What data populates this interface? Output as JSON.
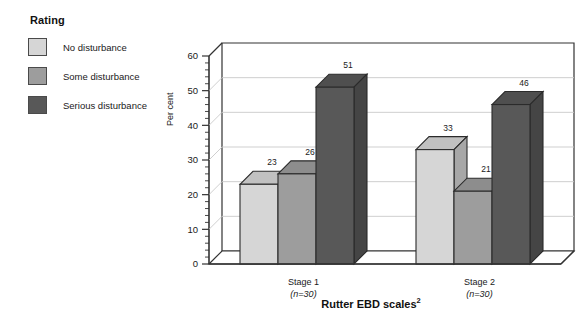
{
  "legend": {
    "title": "Rating",
    "items": [
      {
        "label": "No disturbance",
        "color": "#d6d6d6"
      },
      {
        "label": "Some disturbance",
        "color": "#9d9d9d"
      },
      {
        "label": "Serious disturbance",
        "color": "#585858"
      }
    ]
  },
  "chart_data": {
    "type": "bar",
    "title": "",
    "xlabel": "Rutter EBD scales",
    "xlabel_superscript": "2",
    "ylabel": "Per cent",
    "ylim": [
      0,
      60
    ],
    "ytick_step": 10,
    "yminor_step": 2,
    "grid": true,
    "legend_position": "left",
    "categories": [
      "Stage 1",
      "Stage 2"
    ],
    "category_sublabels": [
      "(n=30)",
      "(n=30)"
    ],
    "ytick_labels": [
      "0",
      "10",
      "20",
      "30",
      "40",
      "50",
      "60"
    ],
    "series": [
      {
        "name": "No disturbance",
        "color": "#d6d6d6",
        "values": [
          23,
          33
        ]
      },
      {
        "name": "Some disturbance",
        "color": "#9d9d9d",
        "values": [
          26,
          21
        ]
      },
      {
        "name": "Serious disturbance",
        "color": "#585858",
        "values": [
          51,
          46
        ]
      }
    ],
    "value_labels": [
      [
        "23",
        "26",
        "51"
      ],
      [
        "33",
        "21",
        "46"
      ]
    ]
  }
}
